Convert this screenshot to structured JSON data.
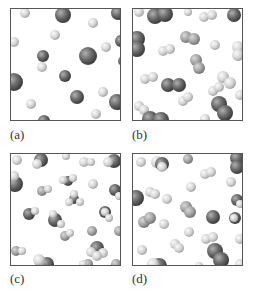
{
  "figure": {
    "panels": [
      {
        "id": "a",
        "label": "(a)",
        "description": "mixture of two kinds of separate atoms (dark large and light small)"
      },
      {
        "id": "b",
        "label": "(b)",
        "description": "mixture of two kinds of diatomic molecules (dark and light)"
      },
      {
        "id": "c",
        "label": "(c)",
        "description": "molecules composed of multiple atoms of different elements"
      },
      {
        "id": "d",
        "label": "(d)",
        "description": "mixture of atoms, diatomic molecules and compound molecules"
      }
    ],
    "colors": {
      "dark_atom": "#6a6a6a",
      "light_atom": "#d6d6d6",
      "border": "#555555",
      "label": "#333333"
    }
  }
}
